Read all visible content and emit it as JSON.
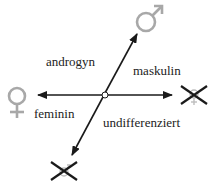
{
  "diagram": {
    "labels": {
      "androgyn": "androgyn",
      "maskulin": "maskulin",
      "feminin": "feminin",
      "undifferenziert": "undifferenziert"
    },
    "symbols": {
      "top_right": "male-symbol",
      "left": "female-symbol",
      "right": "crossed-female-symbol",
      "bottom": "crossed-male-symbol"
    },
    "colors": {
      "symbol_gray": "#a8a8a8",
      "arrow": "#1a1a1a",
      "text": "#222222"
    }
  }
}
